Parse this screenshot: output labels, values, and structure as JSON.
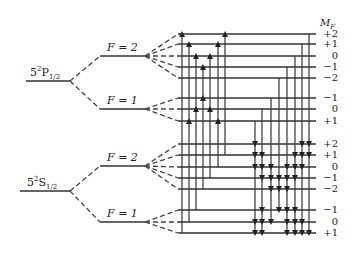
{
  "diagram": {
    "type": "hyperfine Zeeman energy level diagram",
    "column_header": "M",
    "column_header_sub": "F",
    "states": [
      {
        "name": "5²P1/2",
        "main": "5",
        "sup": "2",
        "letter": "P",
        "sub": "1/2",
        "hyperfine": [
          {
            "label": "F = 2",
            "mf_labels": [
              "+2",
              "+1",
              "0",
              "−1",
              "−2"
            ]
          },
          {
            "label": "F = 1",
            "mf_labels": [
              "−1",
              "0",
              "+1"
            ]
          }
        ]
      },
      {
        "name": "5²S1/2",
        "main": "5",
        "sup": "2",
        "letter": "S",
        "sub": "1/2",
        "hyperfine": [
          {
            "label": "F = 2",
            "mf_labels": [
              "+2",
              "+1",
              "0",
              "−1",
              "−2"
            ]
          },
          {
            "label": "F = 1",
            "mf_labels": [
              "−1",
              "0",
              "+1"
            ]
          }
        ]
      }
    ],
    "colors": {
      "line": "#333333",
      "text": "#222222",
      "background": "#ffffff"
    }
  }
}
